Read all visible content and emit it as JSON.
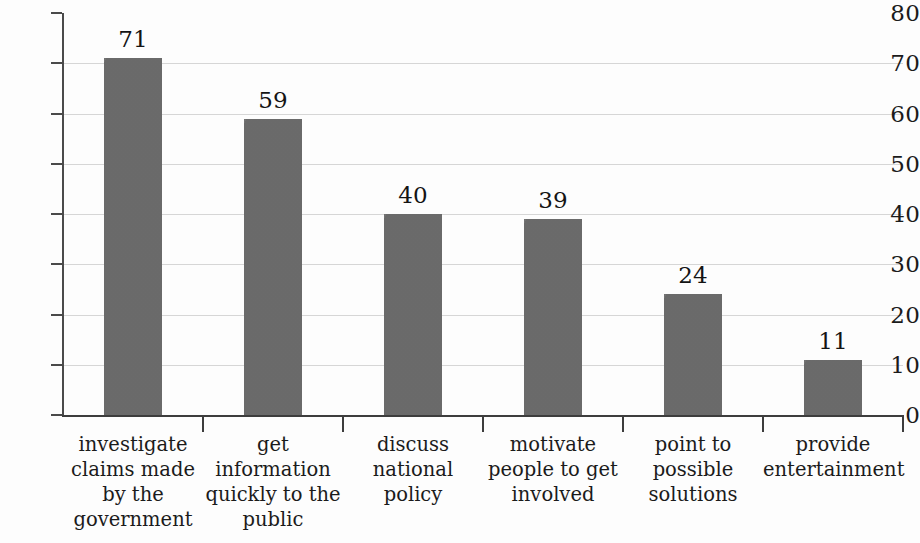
{
  "chart_data": {
    "type": "bar",
    "title": "",
    "subtitle": "",
    "xlabel": "",
    "ylabel": "",
    "ylim": [
      0,
      80
    ],
    "ytick_values": [
      0,
      10,
      20,
      30,
      40,
      50,
      60,
      70,
      80
    ],
    "ytick_labels": [
      "0",
      "10",
      "20",
      "30",
      "40",
      "50",
      "60",
      "70",
      "80"
    ],
    "grid": true,
    "legend": false,
    "legend_position": "none",
    "bar_color": "#6e6e6e",
    "gridline_color": "#d6d6d6",
    "axis_color": "#3d3d3d",
    "text_color": "#1b1b1b",
    "background_color": "#fdfdfd",
    "categories": [
      "investigate claims made by the government",
      "get information quickly to the public",
      "discuss national policy",
      "motivate people to get involved",
      "point to possible solutions",
      "provide entertainment"
    ],
    "category_lines": [
      [
        "investigate",
        "claims made",
        "by the",
        "government"
      ],
      [
        "get",
        "information",
        "quickly to the",
        "public"
      ],
      [
        "discuss",
        "national",
        "policy"
      ],
      [
        "motivate",
        "people to get",
        "involved"
      ],
      [
        "point to",
        "possible",
        "solutions"
      ],
      [
        "provide",
        "entertainment"
      ]
    ],
    "values": [
      71,
      59,
      40,
      39,
      24,
      11
    ],
    "value_labels": [
      "71",
      "59",
      "40",
      "39",
      "24",
      "11"
    ]
  }
}
